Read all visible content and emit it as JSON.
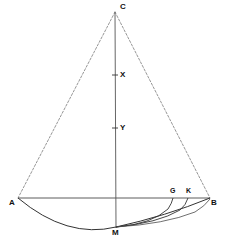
{
  "figure": {
    "type": "geometric-diagram",
    "background_color": "#ffffff",
    "stroke_color": "#333333",
    "dashed_stroke_color": "#888888",
    "label_color": "#111111",
    "width": 227,
    "height": 242,
    "points": {
      "C": {
        "label": "C",
        "x": 115,
        "y": 12,
        "label_x": 120,
        "label_y": 3
      },
      "A": {
        "label": "A",
        "x": 18,
        "y": 198,
        "label_x": 9,
        "label_y": 199
      },
      "B": {
        "label": "B",
        "x": 210,
        "y": 198,
        "label_x": 211,
        "label_y": 199
      },
      "M": {
        "label": "M",
        "x": 116,
        "y": 227,
        "label_x": 112,
        "label_y": 229
      },
      "G": {
        "label": "G",
        "x": 173,
        "y": 198,
        "label_x": 170,
        "label_y": 187
      },
      "K": {
        "label": "K",
        "x": 188,
        "y": 198,
        "label_x": 186,
        "label_y": 187
      },
      "X": {
        "label": "X",
        "x": 115,
        "y": 75,
        "label_x": 120,
        "label_y": 72
      },
      "Y": {
        "label": "Y",
        "x": 115,
        "y": 128,
        "label_x": 120,
        "label_y": 125
      }
    },
    "segments": [
      {
        "name": "side-CA",
        "style": "dashed",
        "from": "C",
        "to": "A"
      },
      {
        "name": "side-CB",
        "style": "dashed",
        "from": "C",
        "to": "B"
      },
      {
        "name": "chord-AB",
        "style": "solid",
        "from": "A",
        "to": "B"
      },
      {
        "name": "axis-CM",
        "style": "solid",
        "from": "C",
        "to": "M"
      }
    ],
    "arcs": [
      {
        "name": "arc-AMB",
        "from": "A",
        "through": "M",
        "to": "B"
      },
      {
        "name": "arc-MG",
        "from": "M",
        "to": "G"
      },
      {
        "name": "arc-MK",
        "from": "M",
        "to": "K"
      }
    ],
    "ticks": [
      {
        "name": "tick-x",
        "y": 75,
        "label": "X"
      },
      {
        "name": "tick-y",
        "y": 128,
        "label": "Y"
      }
    ]
  }
}
